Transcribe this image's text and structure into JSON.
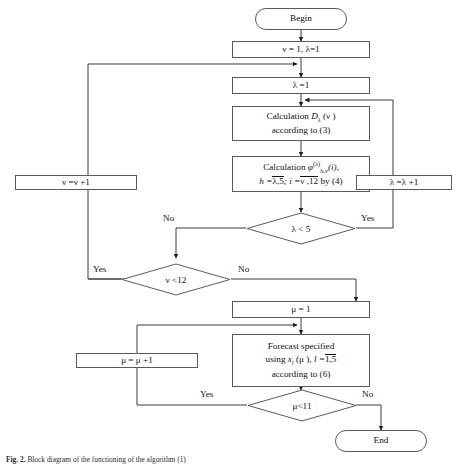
{
  "figure": {
    "caption_label": "Fig. 2.",
    "caption_text": "Block diagram of the functioning of the algorithm (1)"
  },
  "nodes": {
    "begin": {
      "label": "Begin",
      "shape": "terminal"
    },
    "init_nu_lambda": {
      "label": "ν = 1, λ=1",
      "shape": "process"
    },
    "init_lambda": {
      "label": "λ =1",
      "shape": "process"
    },
    "calc_d": {
      "line1_a": "Calculation",
      "line1_b": "D",
      "line1_sub": "λ",
      "line1_c": "(ν )",
      "line2": "according to (3)",
      "shape": "process"
    },
    "calc_phi": {
      "line1_a": "Calculation",
      "line1_sym": "φ",
      "line1_sub": "h,ν",
      "line1_sup": "(λ)",
      "line1_arg": "(i),",
      "line2_a": "h =",
      "line2_b": "λ,5",
      "line2_c": "; i =",
      "line2_d": "ν ,12",
      "line2_e": "by (4)",
      "shape": "process"
    },
    "inc_nu": {
      "label": "ν =ν +1",
      "shape": "process"
    },
    "inc_lambda": {
      "label": "λ =λ +1",
      "shape": "process"
    },
    "dec_lambda": {
      "label": "λ < 5",
      "shape": "decision"
    },
    "dec_nu": {
      "label": "ν <12",
      "shape": "decision"
    },
    "init_mu": {
      "label": "μ = 1",
      "shape": "process"
    },
    "forecast": {
      "line1": "Forecast specified",
      "line2_a": "using",
      "line2_b": "x",
      "line2_sub": "l",
      "line2_c": "(μ ),",
      "line2_d": "l =",
      "line2_e": "1,5",
      "line3": "according to (6)",
      "shape": "process"
    },
    "inc_mu": {
      "label": "μ = μ +1",
      "shape": "process"
    },
    "dec_mu": {
      "label": "μ<11",
      "shape": "decision"
    },
    "end": {
      "label": "End",
      "shape": "terminal"
    }
  },
  "edge_labels": {
    "lambda_no": "No",
    "lambda_yes": "Yes",
    "nu_yes": "Yes",
    "nu_no": "No",
    "mu_yes": "Yes",
    "mu_no": "No"
  },
  "colors": {
    "stroke": "#5a5a5a",
    "wire": "#3a3a3a",
    "text": "#111111",
    "background": "#ffffff"
  }
}
